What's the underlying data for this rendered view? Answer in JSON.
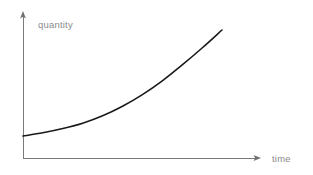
{
  "chart_data": {
    "type": "line",
    "title": "",
    "subtitle": "",
    "xlabel": "time",
    "ylabel": "quantity",
    "legend": [],
    "legend_position": "none",
    "grid": false,
    "ticks": {
      "x": [],
      "y": []
    },
    "axis_style": {
      "arrows": true,
      "color": "#7a7a7a",
      "width": 1
    },
    "xlim": [
      0,
      1
    ],
    "ylim": [
      0,
      1
    ],
    "series": [
      {
        "name": "exponential growth",
        "color": "#1a1a1a",
        "width": 1.6,
        "description": "smooth upward-curving exponential growth curve",
        "x": [
          0.0,
          0.1,
          0.2,
          0.3,
          0.4,
          0.5,
          0.6,
          0.7,
          0.8,
          0.9,
          1.0
        ],
        "y": [
          0.0,
          0.03,
          0.07,
          0.12,
          0.19,
          0.28,
          0.39,
          0.52,
          0.67,
          0.83,
          1.0
        ]
      }
    ],
    "pixel_geometry": {
      "origin": [
        23,
        158
      ],
      "y_axis_top": [
        23,
        13
      ],
      "x_axis_right": [
        259,
        158
      ],
      "curve_start": [
        23,
        136
      ],
      "curve_end": [
        222,
        30
      ]
    }
  },
  "labels": {
    "quantity": "quantity",
    "time": "time"
  },
  "colors": {
    "background": "#ffffff",
    "axis": "#7a7a7a",
    "curve": "#1a1a1a",
    "label_text": "#8a8a8a"
  }
}
